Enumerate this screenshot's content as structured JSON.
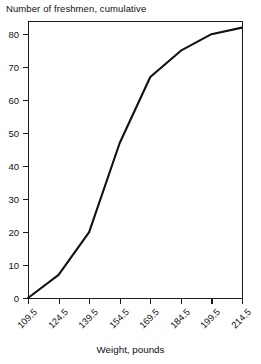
{
  "chart_data": {
    "type": "line",
    "title": "Number of freshmen, cumulative",
    "xlabel": "Weight, pounds",
    "ylabel": "Number of freshmen, cumulative",
    "x": [
      109.5,
      124.5,
      139.5,
      154.5,
      169.5,
      184.5,
      199.5,
      214.5
    ],
    "values": [
      0,
      7,
      20,
      47,
      67,
      75,
      80,
      82
    ],
    "xtick_labels": [
      "109.5",
      "124.5",
      "139.5",
      "154.5",
      "169.5",
      "184.5",
      "199.5",
      "214.5"
    ],
    "ytick_labels": [
      "0",
      "10",
      "20",
      "30",
      "40",
      "50",
      "60",
      "70",
      "80"
    ],
    "ytick_values": [
      0,
      10,
      20,
      30,
      40,
      50,
      60,
      70,
      80
    ],
    "ylim": [
      0,
      84
    ],
    "xlim": [
      109.5,
      214.5
    ],
    "grid": false,
    "legend": false,
    "line_color": "#111111"
  }
}
